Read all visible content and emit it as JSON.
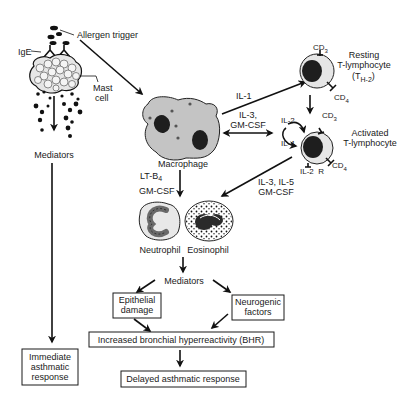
{
  "diagram": {
    "nodes": {
      "allergen": "Allergen trigger",
      "ige": "IgE",
      "mast_cell": [
        "Mast",
        "cell"
      ],
      "mediators_left": "Mediators",
      "immediate_response": [
        "Immediate",
        "asthmatic",
        "response"
      ],
      "macrophage": "Macrophage",
      "resting_t": [
        "Resting",
        "T-lymphocyte"
      ],
      "resting_t_subtype": {
        "main": "(T",
        "sub": "H-2",
        "close": ")"
      },
      "activated_t": [
        "Activated",
        "T-lymphocyte"
      ],
      "neutrophil": "Neutrophil",
      "eosinophil": "Eosinophil",
      "mediators_center": "Mediators",
      "epithelial_damage": [
        "Epithelial",
        "damage"
      ],
      "neurogenic_factors": [
        "Neurogenic",
        "factors"
      ],
      "bhr": "Increased bronchial hyperreactivity (BHR)",
      "delayed_response": "Delayed asthmatic response"
    },
    "markers": {
      "cd3_resting": {
        "main": "CD",
        "sub": "3"
      },
      "cd4_resting": {
        "main": "CD",
        "sub": "4"
      },
      "cd3_activated": {
        "main": "CD",
        "sub": "3"
      },
      "cd4_activated": {
        "main": "CD",
        "sub": "4"
      },
      "il2_receptor": "IL-2  R"
    },
    "edge_labels": {
      "il1": "IL-1",
      "il3_gmcsf": [
        "IL-3,",
        "GM-CSF"
      ],
      "il2": "IL-2",
      "il4": "IL-4",
      "lt_b4": {
        "main": "LT-B",
        "sub": "4"
      },
      "gmcsf_left": "GM-CSF",
      "il3_il5": [
        "IL-3, IL-5",
        "GM-CSF"
      ]
    },
    "colors": {
      "ink": "#1a1a1a",
      "cell_fill": "#c8c8c8",
      "nucleus": "#1e1e1e",
      "cytoplasm_light": "#e6e6e6"
    }
  }
}
